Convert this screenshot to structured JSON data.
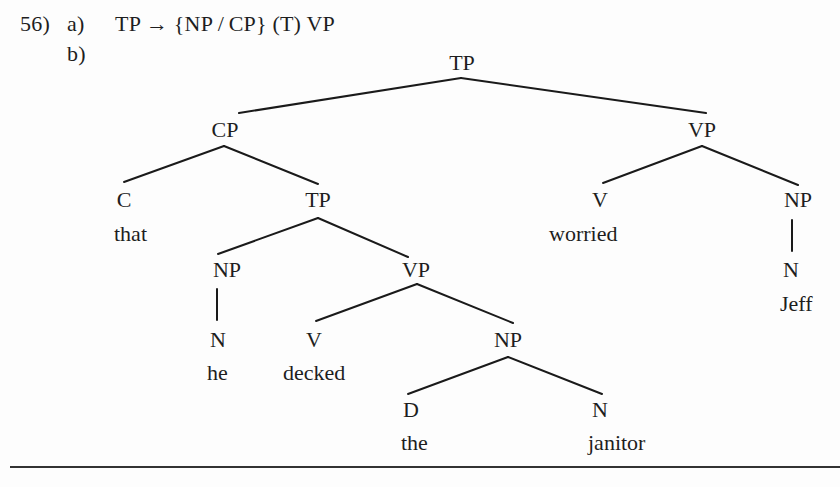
{
  "example": {
    "number": "56)",
    "part_a": {
      "label": "a)",
      "rule": "TP → {NP / CP} (T) VP"
    },
    "part_b": {
      "label": "b)"
    }
  },
  "tree": {
    "nodes": [
      {
        "id": "tp-root",
        "label": "TP",
        "x": 462,
        "y": 52
      },
      {
        "id": "cp",
        "label": "CP",
        "x": 225,
        "y": 119
      },
      {
        "id": "vp-matrix",
        "label": "VP",
        "x": 702,
        "y": 119
      },
      {
        "id": "c",
        "label": "C",
        "x": 124,
        "y": 189
      },
      {
        "id": "tp-embedded",
        "label": "TP",
        "x": 318,
        "y": 189
      },
      {
        "id": "v-matrix",
        "label": "V",
        "x": 600,
        "y": 189
      },
      {
        "id": "np-object",
        "label": "NP",
        "x": 798,
        "y": 189
      },
      {
        "id": "np-subject",
        "label": "NP",
        "x": 227,
        "y": 259
      },
      {
        "id": "vp-embedded",
        "label": "VP",
        "x": 416,
        "y": 259
      },
      {
        "id": "n-jeff",
        "label": "N",
        "x": 791,
        "y": 259
      },
      {
        "id": "n-he",
        "label": "N",
        "x": 218,
        "y": 329
      },
      {
        "id": "v-embedded",
        "label": "V",
        "x": 314,
        "y": 329
      },
      {
        "id": "np-embedded-object",
        "label": "NP",
        "x": 508,
        "y": 329
      },
      {
        "id": "d",
        "label": "D",
        "x": 411,
        "y": 399
      },
      {
        "id": "n-janitor",
        "label": "N",
        "x": 600,
        "y": 399
      }
    ],
    "words": [
      {
        "id": "word-that",
        "text": "that",
        "x": 114,
        "y": 223
      },
      {
        "id": "word-worried",
        "text": "worried",
        "x": 549,
        "y": 223
      },
      {
        "id": "word-jeff",
        "text": "Jeff",
        "x": 780,
        "y": 293
      },
      {
        "id": "word-he",
        "text": "he",
        "x": 207,
        "y": 362
      },
      {
        "id": "word-decked",
        "text": "decked",
        "x": 283,
        "y": 362
      },
      {
        "id": "word-the",
        "text": "the",
        "x": 401,
        "y": 432
      },
      {
        "id": "word-janitor",
        "text": "janitor",
        "x": 588,
        "y": 432
      }
    ],
    "edges": [
      {
        "from": "tp-root",
        "to": "cp",
        "x1": 461,
        "y1": 78,
        "x2": 239,
        "y2": 113
      },
      {
        "from": "tp-root",
        "to": "vp-matrix",
        "x1": 461,
        "y1": 78,
        "x2": 706,
        "y2": 113
      },
      {
        "from": "cp",
        "to": "c",
        "x1": 224,
        "y1": 146,
        "x2": 124,
        "y2": 182
      },
      {
        "from": "cp",
        "to": "tp-embedded",
        "x1": 224,
        "y1": 146,
        "x2": 318,
        "y2": 184
      },
      {
        "from": "vp-matrix",
        "to": "v-matrix",
        "x1": 702,
        "y1": 146,
        "x2": 603,
        "y2": 183
      },
      {
        "from": "vp-matrix",
        "to": "np-object",
        "x1": 702,
        "y1": 146,
        "x2": 798,
        "y2": 185
      },
      {
        "from": "tp-embedded",
        "to": "np-subject",
        "x1": 318,
        "y1": 218,
        "x2": 218,
        "y2": 254
      },
      {
        "from": "tp-embedded",
        "to": "vp-embedded",
        "x1": 318,
        "y1": 218,
        "x2": 408,
        "y2": 257
      },
      {
        "from": "np-object",
        "to": "n-jeff",
        "x1": 792,
        "y1": 220,
        "x2": 792,
        "y2": 251
      },
      {
        "from": "np-subject",
        "to": "n-he",
        "x1": 217,
        "y1": 289,
        "x2": 217,
        "y2": 320
      },
      {
        "from": "vp-embedded",
        "to": "v-embedded",
        "x1": 417,
        "y1": 284,
        "x2": 316,
        "y2": 321
      },
      {
        "from": "vp-embedded",
        "to": "np-embedded-object",
        "x1": 417,
        "y1": 284,
        "x2": 513,
        "y2": 323
      },
      {
        "from": "np-embedded-object",
        "to": "d",
        "x1": 508,
        "y1": 357,
        "x2": 408,
        "y2": 394
      },
      {
        "from": "np-embedded-object",
        "to": "n-janitor",
        "x1": 508,
        "y1": 357,
        "x2": 602,
        "y2": 394
      }
    ]
  }
}
